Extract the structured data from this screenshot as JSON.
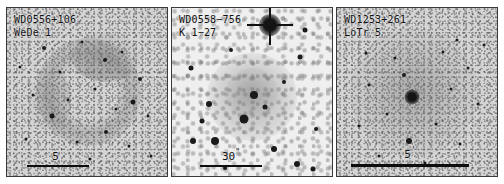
{
  "figure": {
    "kind": "astronomical-image-panels",
    "panel_count": 3,
    "background_color": "#ffffff",
    "border_color": "#3a3a3a"
  },
  "panels": [
    {
      "id": "panel-wede1",
      "designation": "WD0556+106",
      "nebula_name": "WeDe 1",
      "scale_value": "5",
      "scale_unit_mark": "'",
      "scale_bar_px": 62,
      "background_tone": "#d4d4d4",
      "description": "faint ring nebula with mottled star field"
    },
    {
      "id": "panel-k127",
      "designation": "WD0558−756",
      "nebula_name": "K 1−27",
      "scale_value": "30",
      "scale_unit_mark": "\"",
      "scale_bar_px": 62,
      "background_tone": "#efefef",
      "description": "diffuse round nebula, bright saturated star at top right"
    },
    {
      "id": "panel-lotr5",
      "designation": "WD1253+261",
      "nebula_name": "LoTr 5",
      "scale_value": "5",
      "scale_unit_mark": "'",
      "scale_bar_px": 118,
      "background_tone": "#d9d9d9",
      "description": "large diffuse halo around a prominent central star"
    }
  ]
}
